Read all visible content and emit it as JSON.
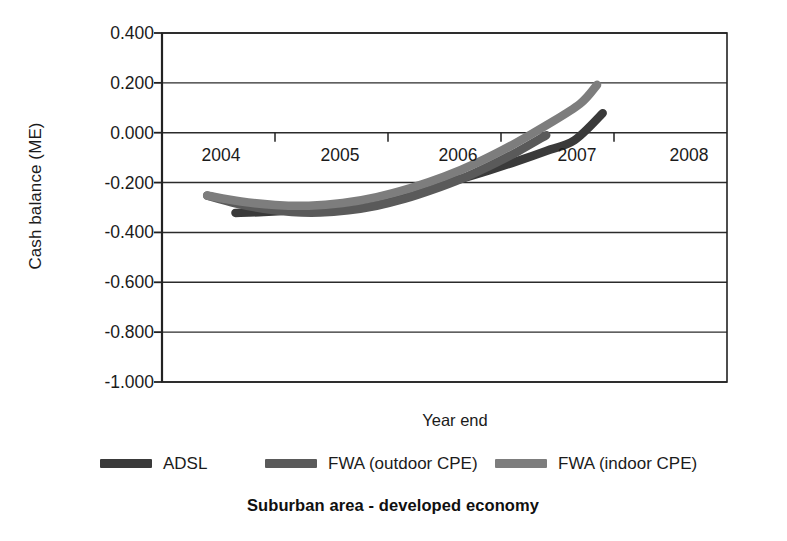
{
  "chart_data": {
    "type": "line",
    "title": "Suburban area - developed economy",
    "xlabel": "Year end",
    "ylabel": "Cash balance (ME)",
    "ylim": [
      -1.0,
      0.4
    ],
    "xlim": [
      2003.5,
      2008.5
    ],
    "grid": true,
    "legend_position": "bottom",
    "y_ticks": [
      "0.400",
      "0.200",
      "0.000",
      "-0.200",
      "-0.400",
      "-0.600",
      "-0.800",
      "-1.000"
    ],
    "y_tick_values": [
      0.4,
      0.2,
      0.0,
      -0.2,
      -0.4,
      -0.6,
      -0.8,
      -1.0
    ],
    "x_ticks": [
      "2004",
      "2005",
      "2006",
      "2007",
      "2008"
    ],
    "x_tick_values": [
      2004,
      2005,
      2006,
      2007,
      2008
    ],
    "series": [
      {
        "name": "ADSL",
        "color": "#3a3a3a",
        "x": [
          2004.15,
          2004.4,
          2004.65,
          2004.9,
          2005.15,
          2005.4,
          2005.65,
          2005.9,
          2006.15,
          2006.4,
          2006.65,
          2006.9,
          2007.15,
          2007.4
        ],
        "values": [
          -0.322,
          -0.318,
          -0.31,
          -0.298,
          -0.283,
          -0.264,
          -0.241,
          -0.214,
          -0.184,
          -0.15,
          -0.113,
          -0.073,
          -0.03,
          0.078
        ]
      },
      {
        "name": "FWA (outdoor CPE)",
        "color": "#5a5a5a",
        "x": [
          2003.9,
          2004.15,
          2004.4,
          2004.65,
          2004.9,
          2005.15,
          2005.4,
          2005.65,
          2005.9,
          2006.15,
          2006.4,
          2006.65,
          2006.9
        ],
        "values": [
          -0.252,
          -0.283,
          -0.305,
          -0.318,
          -0.32,
          -0.311,
          -0.293,
          -0.265,
          -0.228,
          -0.185,
          -0.133,
          -0.075,
          -0.01
        ]
      },
      {
        "name": "FWA (indoor CPE)",
        "color": "#7d7d7d",
        "x": [
          2003.9,
          2004.2,
          2004.5,
          2004.8,
          2005.1,
          2005.4,
          2005.7,
          2006.0,
          2006.3,
          2006.6,
          2006.9,
          2007.2,
          2007.35
        ],
        "values": [
          -0.252,
          -0.276,
          -0.29,
          -0.293,
          -0.282,
          -0.258,
          -0.222,
          -0.176,
          -0.118,
          -0.049,
          0.029,
          0.116,
          0.192
        ]
      }
    ]
  },
  "axes": {
    "y_label": "Cash balance (ME)",
    "x_label": "Year end"
  },
  "title": "Suburban area - developed economy",
  "legend": {
    "items": [
      {
        "label": "ADSL",
        "color": "#3a3a3a"
      },
      {
        "label": "FWA (outdoor CPE)",
        "color": "#5a5a5a"
      },
      {
        "label": "FWA (indoor CPE)",
        "color": "#7d7d7d"
      }
    ]
  },
  "colors": {
    "axis": "#222222",
    "grid": "#2b2b2b",
    "background": "#ffffff",
    "text": "#1b1b1b"
  }
}
